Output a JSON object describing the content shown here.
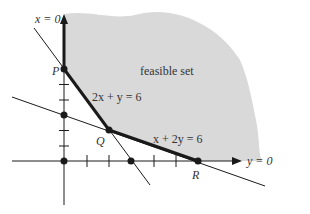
{
  "diagram": {
    "colors": {
      "feasible_fill": "#d9d9d9",
      "line": "#1a1a1a",
      "text": "#333333",
      "background": "#ffffff"
    },
    "labels": {
      "y_axis_eq": "x = 0",
      "x_axis_eq": "y = 0",
      "region": "feasible set",
      "line1": "2x + y = 6",
      "line2": "x + 2y = 6",
      "point_p": "P",
      "point_q": "Q",
      "point_r": "R"
    },
    "points": [
      {
        "name": "P",
        "x": 0,
        "y": 6
      },
      {
        "name": "Q",
        "x": 2,
        "y": 2
      },
      {
        "name": "R",
        "x": 6,
        "y": 0
      },
      {
        "name": "origin",
        "x": 0,
        "y": 0
      },
      {
        "name": "y-intercept of x+2y=6",
        "x": 0,
        "y": 3
      },
      {
        "name": "x-intercept of 2x+y=6",
        "x": 3,
        "y": 0
      }
    ],
    "constraints": [
      "2x + y >= 6",
      "x + 2y >= 6",
      "x >= 0",
      "y >= 0"
    ]
  }
}
